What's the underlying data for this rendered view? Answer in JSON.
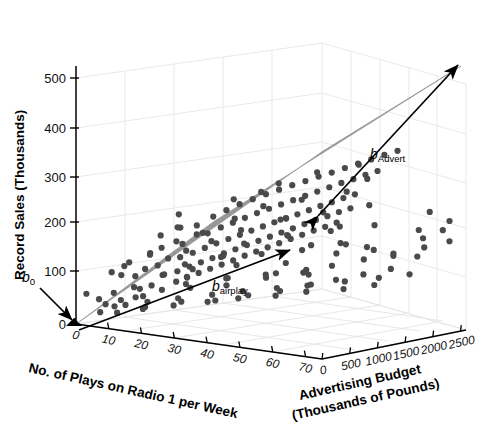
{
  "figure": {
    "kind": "3d-scatter-with-regression-plane",
    "background": "#ffffff",
    "plane_color": "#9a9a9a",
    "point_color": "#4a4a4a",
    "axis_color": "#000000",
    "grid_color": "#e2e2e6"
  },
  "axes": {
    "y": {
      "label": "Record Sales (Thousands)",
      "ticks": [
        "0",
        "100",
        "200",
        "300",
        "400",
        "500"
      ],
      "values": [
        0,
        100,
        200,
        300,
        400,
        500
      ],
      "range": [
        0,
        540
      ]
    },
    "x": {
      "label": "No. of Plays on Radio 1 per Week",
      "ticks": [
        "0",
        "10",
        "20",
        "30",
        "40",
        "50",
        "60",
        "70"
      ],
      "values": [
        0,
        10,
        20,
        30,
        40,
        50,
        60,
        70
      ],
      "range": [
        0,
        75
      ]
    },
    "z": {
      "label_line1": "Advertising Budget",
      "label_line2": "(Thousands of Pounds)",
      "ticks": [
        "0",
        "500",
        "1000",
        "1500",
        "2000",
        "2500"
      ],
      "values": [
        0,
        500,
        1000,
        1500,
        2000,
        2500
      ],
      "range": [
        0,
        2600
      ]
    }
  },
  "annotations": [
    {
      "name": "b0",
      "base": "b",
      "sub": "0",
      "kind": "intercept-arrow"
    },
    {
      "name": "bairplay",
      "base": "b",
      "sub": "airplay",
      "kind": "slope-arrow"
    },
    {
      "name": "bAdvert",
      "base": "b",
      "sub": "Advert",
      "kind": "slope-arrow"
    }
  ],
  "chart_data": {
    "type": "scatter",
    "title": "",
    "xlabel": "No. of Plays on Radio 1 per Week",
    "ylabel": "Record Sales (Thousands)",
    "zlabel": "Advertising Budget (Thousands of Pounds)",
    "xlim": [
      0,
      75
    ],
    "ylim": [
      0,
      540
    ],
    "zlim": [
      0,
      2600
    ],
    "grid": true,
    "legend": "none",
    "model": "sales = b0 + b_airplay * airplay + b_Advert * advert",
    "annotations": [
      "b0",
      "b_airplay",
      "b_Advert"
    ],
    "n_points": 200,
    "points_xyz": [
      [
        3,
        66,
        10
      ],
      [
        5,
        54,
        120
      ],
      [
        7,
        110,
        230
      ],
      [
        8,
        48,
        60
      ],
      [
        9,
        122,
        340
      ],
      [
        10,
        73,
        90
      ],
      [
        11,
        101,
        420
      ],
      [
        12,
        135,
        250
      ],
      [
        13,
        62,
        40
      ],
      [
        14,
        150,
        510
      ],
      [
        15,
        88,
        160
      ],
      [
        15,
        185,
        640
      ],
      [
        16,
        124,
        300
      ],
      [
        17,
        71,
        70
      ],
      [
        18,
        166,
        480
      ],
      [
        19,
        133,
        350
      ],
      [
        20,
        96,
        180
      ],
      [
        20,
        205,
        700
      ],
      [
        21,
        148,
        420
      ],
      [
        22,
        118,
        260
      ],
      [
        23,
        177,
        560
      ],
      [
        24,
        92,
        130
      ],
      [
        24,
        212,
        760
      ],
      [
        25,
        155,
        400
      ],
      [
        26,
        129,
        290
      ],
      [
        26,
        198,
        640
      ],
      [
        27,
        110,
        210
      ],
      [
        28,
        233,
        820
      ],
      [
        28,
        166,
        450
      ],
      [
        29,
        141,
        330
      ],
      [
        30,
        205,
        600
      ],
      [
        30,
        121,
        230
      ],
      [
        31,
        248,
        880
      ],
      [
        31,
        178,
        490
      ],
      [
        32,
        152,
        360
      ],
      [
        33,
        219,
        660
      ],
      [
        33,
        133,
        260
      ],
      [
        34,
        262,
        940
      ],
      [
        34,
        190,
        520
      ],
      [
        35,
        163,
        390
      ],
      [
        36,
        231,
        700
      ],
      [
        36,
        144,
        290
      ],
      [
        37,
        274,
        1000
      ],
      [
        37,
        201,
        560
      ],
      [
        38,
        175,
        420
      ],
      [
        39,
        243,
        740
      ],
      [
        39,
        155,
        320
      ],
      [
        40,
        286,
        1060
      ],
      [
        40,
        212,
        590
      ],
      [
        41,
        186,
        450
      ],
      [
        42,
        255,
        780
      ],
      [
        42,
        166,
        350
      ],
      [
        43,
        297,
        1120
      ],
      [
        43,
        223,
        620
      ],
      [
        44,
        197,
        480
      ],
      [
        45,
        266,
        820
      ],
      [
        45,
        178,
        380
      ],
      [
        46,
        308,
        1180
      ],
      [
        46,
        234,
        650
      ],
      [
        47,
        208,
        510
      ],
      [
        48,
        277,
        860
      ],
      [
        48,
        189,
        410
      ],
      [
        49,
        318,
        1240
      ],
      [
        49,
        245,
        680
      ],
      [
        50,
        219,
        540
      ],
      [
        51,
        288,
        900
      ],
      [
        51,
        200,
        440
      ],
      [
        52,
        329,
        1300
      ],
      [
        52,
        256,
        710
      ],
      [
        53,
        230,
        570
      ],
      [
        54,
        299,
        940
      ],
      [
        54,
        211,
        470
      ],
      [
        55,
        339,
        1360
      ],
      [
        55,
        266,
        740
      ],
      [
        56,
        241,
        600
      ],
      [
        57,
        310,
        980
      ],
      [
        57,
        222,
        500
      ],
      [
        58,
        350,
        1420
      ],
      [
        58,
        277,
        770
      ],
      [
        59,
        252,
        630
      ],
      [
        60,
        321,
        1020
      ],
      [
        60,
        233,
        530
      ],
      [
        61,
        361,
        1480
      ],
      [
        61,
        288,
        800
      ],
      [
        62,
        263,
        660
      ],
      [
        63,
        332,
        1060
      ],
      [
        63,
        244,
        560
      ],
      [
        64,
        371,
        1540
      ],
      [
        64,
        298,
        830
      ],
      [
        65,
        273,
        690
      ],
      [
        66,
        342,
        1100
      ],
      [
        66,
        254,
        590
      ],
      [
        67,
        382,
        1600
      ],
      [
        67,
        309,
        860
      ],
      [
        68,
        284,
        720
      ],
      [
        69,
        353,
        1140
      ],
      [
        69,
        265,
        620
      ],
      [
        70,
        392,
        1660
      ],
      [
        70,
        319,
        890
      ],
      [
        71,
        294,
        750
      ],
      [
        72,
        363,
        1180
      ],
      [
        12,
        95,
        880
      ],
      [
        14,
        140,
        1160
      ],
      [
        17,
        119,
        960
      ],
      [
        19,
        161,
        1320
      ],
      [
        22,
        104,
        700
      ],
      [
        25,
        186,
        1500
      ],
      [
        27,
        143,
        1020
      ],
      [
        30,
        168,
        1260
      ],
      [
        33,
        110,
        760
      ],
      [
        35,
        215,
        1620
      ],
      [
        38,
        158,
        1100
      ],
      [
        41,
        192,
        1400
      ],
      [
        44,
        127,
        820
      ],
      [
        46,
        238,
        1740
      ],
      [
        49,
        175,
        1180
      ],
      [
        52,
        210,
        1520
      ],
      [
        55,
        146,
        900
      ],
      [
        58,
        262,
        1860
      ],
      [
        61,
        197,
        1260
      ],
      [
        64,
        232,
        1600
      ],
      [
        8,
        38,
        420
      ],
      [
        11,
        56,
        560
      ],
      [
        16,
        44,
        300
      ],
      [
        21,
        77,
        820
      ],
      [
        24,
        59,
        480
      ],
      [
        29,
        86,
        1000
      ],
      [
        32,
        66,
        620
      ],
      [
        37,
        104,
        1240
      ],
      [
        40,
        82,
        740
      ],
      [
        45,
        118,
        1440
      ],
      [
        47,
        94,
        900
      ],
      [
        50,
        132,
        1660
      ],
      [
        53,
        108,
        1040
      ],
      [
        56,
        146,
        1880
      ],
      [
        59,
        122,
        1200
      ],
      [
        62,
        160,
        2060
      ],
      [
        65,
        136,
        1340
      ],
      [
        68,
        174,
        2260
      ],
      [
        71,
        150,
        1480
      ],
      [
        73,
        188,
        2420
      ],
      [
        6,
        128,
        980
      ],
      [
        9,
        152,
        1280
      ],
      [
        13,
        168,
        1520
      ],
      [
        18,
        196,
        1800
      ],
      [
        23,
        222,
        2020
      ],
      [
        26,
        142,
        1120
      ],
      [
        31,
        238,
        2240
      ],
      [
        36,
        182,
        1680
      ],
      [
        42,
        262,
        2400
      ],
      [
        48,
        206,
        1920
      ],
      [
        4,
        24,
        200
      ],
      [
        6,
        35,
        340
      ],
      [
        10,
        30,
        150
      ],
      [
        13,
        47,
        520
      ],
      [
        16,
        41,
        260
      ],
      [
        20,
        58,
        660
      ],
      [
        23,
        52,
        400
      ],
      [
        28,
        70,
        800
      ],
      [
        31,
        64,
        540
      ],
      [
        35,
        81,
        940
      ],
      [
        38,
        75,
        680
      ],
      [
        43,
        92,
        1080
      ],
      [
        47,
        86,
        820
      ],
      [
        51,
        104,
        1220
      ],
      [
        54,
        98,
        960
      ],
      [
        59,
        115,
        1360
      ],
      [
        63,
        109,
        1100
      ],
      [
        67,
        127,
        1500
      ],
      [
        70,
        121,
        1240
      ],
      [
        74,
        138,
        1640
      ],
      [
        15,
        230,
        1960
      ],
      [
        25,
        268,
        2180
      ],
      [
        34,
        296,
        2340
      ],
      [
        44,
        318,
        2500
      ],
      [
        53,
        306,
        2120
      ],
      [
        2,
        88,
        700
      ],
      [
        5,
        198,
        1560
      ],
      [
        7,
        176,
        1420
      ],
      [
        18,
        108,
        1040
      ],
      [
        29,
        124,
        1180
      ],
      [
        39,
        114,
        1300
      ],
      [
        50,
        156,
        1740
      ],
      [
        57,
        164,
        2000
      ],
      [
        66,
        208,
        2280
      ],
      [
        72,
        228,
        2480
      ],
      [
        21,
        248,
        2100
      ],
      [
        33,
        210,
        1840
      ],
      [
        45,
        172,
        1580
      ],
      [
        56,
        190,
        1460
      ],
      [
        68,
        246,
        2360
      ],
      [
        9,
        68,
        620
      ],
      [
        19,
        82,
        860
      ],
      [
        27,
        96,
        1140
      ],
      [
        41,
        136,
        1360
      ],
      [
        52,
        128,
        1120
      ],
      [
        60,
        180,
        1700
      ],
      [
        64,
        160,
        1940
      ],
      [
        69,
        196,
        2180
      ],
      [
        73,
        214,
        2300
      ],
      [
        74,
        172,
        1780
      ]
    ]
  }
}
